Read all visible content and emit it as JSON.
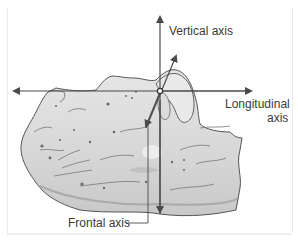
{
  "figure": {
    "labels": {
      "vertical_axis": "Vertical axis",
      "longitudinal_axis_line1": "Longitudinal",
      "longitudinal_axis_line2": "axis",
      "frontal_axis": "Frontal axis"
    },
    "colors": {
      "axis_line": "#4a4a4a",
      "bone_fill": "#d9d9d9",
      "bone_outline": "#555555",
      "label_text": "#3a3a3a",
      "frame": "#ececec"
    }
  }
}
